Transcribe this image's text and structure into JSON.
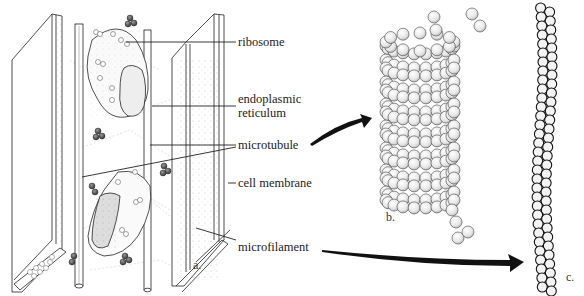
{
  "figure": {
    "labels": {
      "ribosome": "ribosome",
      "endoplasmic_reticulum_line1": "endoplasmic",
      "endoplasmic_reticulum_line2": "reticulum",
      "microtubule": "microtubule",
      "cell_membrane": "cell membrane",
      "microfilament": "microfilament"
    },
    "panels": {
      "a": "a.",
      "b": "b.",
      "c": "c."
    }
  }
}
